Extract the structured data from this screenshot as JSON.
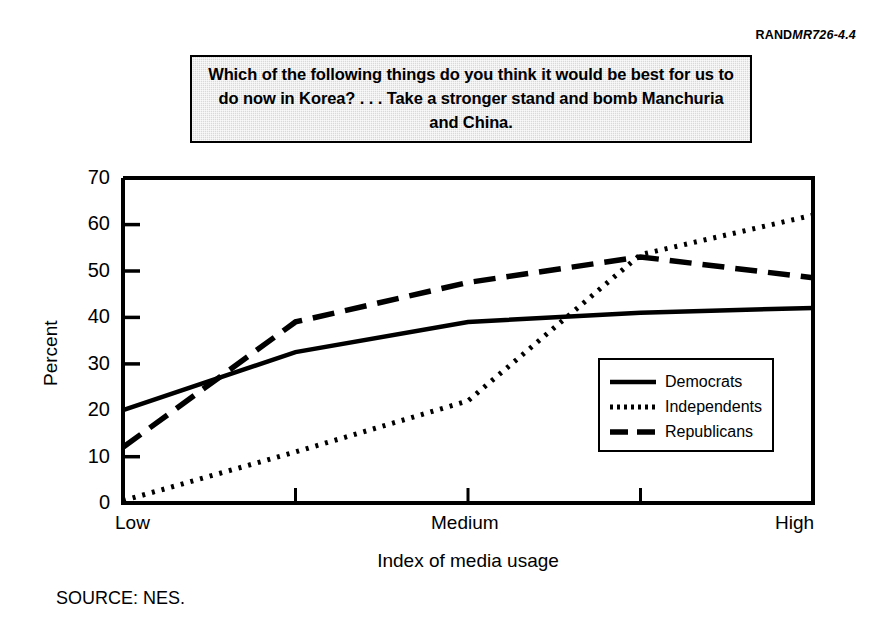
{
  "slug": {
    "brand": "RAND",
    "code": "MR726-4.4"
  },
  "question": {
    "text": "Which of the following things do you think it would be best for us to do now in Korea? . . . Take a stronger stand and bomb Manchuria and China."
  },
  "source": {
    "label": "SOURCE:  NES."
  },
  "legend": {
    "position": "inside-lower-right",
    "entries": [
      {
        "label": "Democrats",
        "style": "solid"
      },
      {
        "label": "Independents",
        "style": "dotted"
      },
      {
        "label": "Republicans",
        "style": "dashed"
      }
    ]
  },
  "chart_data": {
    "type": "line",
    "title": "Which of the following things do you think it would be best for us to do now in Korea? . . . Take a stronger stand and bomb Manchuria and China.",
    "xlabel": "Index of media usage",
    "ylabel": "Percent",
    "ylim": [
      0,
      70
    ],
    "yticks": [
      0,
      10,
      20,
      30,
      40,
      50,
      60,
      70
    ],
    "grid": false,
    "x": [
      1,
      2,
      3,
      4,
      5
    ],
    "categories": [
      "Low",
      "",
      "Medium",
      "",
      "High"
    ],
    "xtick_labels": [
      "Low",
      "Medium",
      "High"
    ],
    "series": [
      {
        "name": "Democrats",
        "style": "solid",
        "color": "#000000",
        "values": [
          20,
          32.5,
          39,
          41,
          42
        ]
      },
      {
        "name": "Independents",
        "style": "dotted",
        "color": "#000000",
        "values": [
          0.5,
          11,
          22,
          53.5,
          62
        ]
      },
      {
        "name": "Republicans",
        "style": "dashed",
        "color": "#000000",
        "values": [
          12,
          39,
          47.5,
          53,
          48.5
        ]
      }
    ]
  },
  "axis_labels": {
    "y_ticks": [
      "70",
      "60",
      "50",
      "40",
      "30",
      "20",
      "10",
      "0"
    ],
    "x_ticks": [
      "Low",
      "Medium",
      "High"
    ]
  }
}
